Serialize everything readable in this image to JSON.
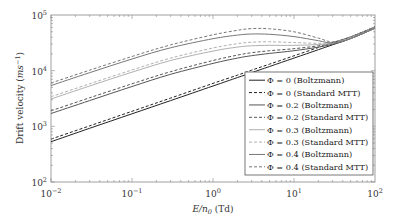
{
  "chart_data": {
    "type": "line",
    "title": "",
    "xlabel": "E/n0 (Td)",
    "xlabel_parts": {
      "italic": "E/n",
      "sub": "0",
      "rest": " (Td)"
    },
    "ylabel": "Drift velocity (ms^-1)",
    "ylabel_parts": {
      "plain": "Drift velocity (",
      "italic": "ms",
      "sup": "−1",
      "close": ")"
    },
    "xscale": "log",
    "yscale": "log",
    "xlim": [
      0.01,
      100
    ],
    "ylim": [
      100,
      100000
    ],
    "x_ticks": [
      {
        "base": "10",
        "exp": "−2",
        "value": 0.01
      },
      {
        "base": "10",
        "exp": "−1",
        "value": 0.1
      },
      {
        "base": "10",
        "exp": "0",
        "value": 1
      },
      {
        "base": "10",
        "exp": "1",
        "value": 10
      },
      {
        "base": "10",
        "exp": "2",
        "value": 100
      }
    ],
    "y_ticks": [
      {
        "base": "10",
        "exp": "2",
        "value": 100
      },
      {
        "base": "10",
        "exp": "3",
        "value": 1000
      },
      {
        "base": "10",
        "exp": "4",
        "value": 10000
      },
      {
        "base": "10",
        "exp": "5",
        "value": 100000
      }
    ],
    "grid": false,
    "legend_position": "lower right",
    "x": [
      0.01,
      0.03,
      0.1,
      0.3,
      1,
      2,
      3,
      5,
      10,
      20,
      30,
      50,
      100
    ],
    "series": [
      {
        "name": "Φ = 0 (Boltzmann)",
        "style": "solid",
        "color": "#222222",
        "values": [
          530,
          920,
          1680,
          2900,
          5300,
          7500,
          9200,
          11900,
          16800,
          23800,
          29200,
          37600,
          58000
        ]
      },
      {
        "name": "Φ = 0 (Standard MTT)",
        "style": "dashed",
        "color": "#222222",
        "values": [
          590,
          1020,
          1860,
          3220,
          5900,
          8300,
          10200,
          13100,
          18500,
          26100,
          31900,
          40500,
          61000
        ]
      },
      {
        "name": "Φ = 0.2 (Boltzmann)",
        "style": "solid",
        "color": "#555555",
        "values": [
          1700,
          2900,
          5200,
          8600,
          13500,
          16800,
          18600,
          20400,
          22800,
          26500,
          30000,
          37800,
          58000
        ]
      },
      {
        "name": "Φ = 0.2 (Standard MTT)",
        "style": "dashed",
        "color": "#555555",
        "values": [
          1900,
          3250,
          5800,
          9600,
          15200,
          19000,
          21000,
          22800,
          24800,
          28000,
          31500,
          40500,
          61000
        ]
      },
      {
        "name": "Φ = 0.3 (Boltzmann)",
        "style": "solid",
        "color": "#b0b0b0",
        "values": [
          3100,
          5300,
          9400,
          15200,
          22500,
          26500,
          28000,
          28500,
          28500,
          29500,
          31000,
          37800,
          58000
        ]
      },
      {
        "name": "Φ = 0.3 (Standard MTT)",
        "style": "dashed",
        "color": "#b0b0b0",
        "values": [
          3400,
          5800,
          10300,
          16800,
          25500,
          30500,
          32500,
          33000,
          32000,
          31000,
          32000,
          40500,
          61000
        ]
      },
      {
        "name": "Φ = 0.4 (Boltzmann)",
        "style": "solid",
        "color": "#777777",
        "values": [
          5400,
          9200,
          16200,
          25800,
          37500,
          43500,
          45500,
          45000,
          41000,
          34500,
          31500,
          37800,
          58000
        ]
      },
      {
        "name": "Φ = 0.4 (Standard MTT)",
        "style": "dashed",
        "color": "#777777",
        "values": [
          6000,
          10200,
          18000,
          29000,
          44000,
          53000,
          57000,
          56500,
          50000,
          38500,
          33000,
          40500,
          61000
        ]
      }
    ]
  }
}
